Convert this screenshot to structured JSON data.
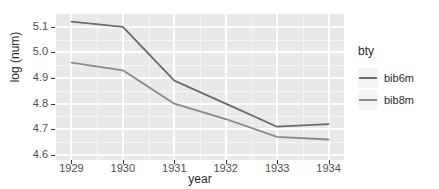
{
  "chart_data": {
    "type": "line",
    "title": "",
    "xlabel": "year",
    "ylabel": "log (num)",
    "x": [
      1929,
      1930,
      1931,
      1932,
      1933,
      1934
    ],
    "xticklabels": [
      "1929",
      "1930",
      "1931",
      "1932",
      "1933",
      "1934"
    ],
    "yticklabels": [
      "5.1",
      "5.0",
      "4.9",
      "4.8",
      "4.7",
      "4.6"
    ],
    "yticks": [
      5.1,
      5.0,
      4.9,
      4.8,
      4.7,
      4.6
    ],
    "xlim": [
      1928.7,
      1934.3
    ],
    "ylim": [
      4.58,
      5.15
    ],
    "grid": true,
    "legend_position": "right",
    "legend_title": "bty",
    "series": [
      {
        "name": "bib6m",
        "color": "#6b6b6b",
        "values": [
          5.12,
          5.1,
          4.89,
          4.8,
          4.71,
          4.72
        ]
      },
      {
        "name": "bib8m",
        "color": "#8a8a8a",
        "values": [
          4.96,
          4.93,
          4.8,
          4.74,
          4.67,
          4.66
        ]
      }
    ]
  },
  "panel": {
    "background_color": "#e9e9e9",
    "gridline_color": "#ffffff"
  }
}
